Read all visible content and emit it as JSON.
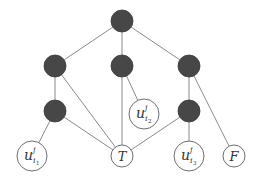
{
  "diagram": {
    "type": "graph",
    "colors": {
      "filled_node": "#474747",
      "edge": "#8a8a8a",
      "open_node_stroke": "#6e6e6e",
      "background": "#ffffff"
    },
    "nodes": [
      {
        "id": "top",
        "kind": "filled",
        "x": 122,
        "y": 21,
        "r": 11
      },
      {
        "id": "l1",
        "kind": "filled",
        "x": 55,
        "y": 66,
        "r": 11
      },
      {
        "id": "m1",
        "kind": "filled",
        "x": 122,
        "y": 66,
        "r": 11
      },
      {
        "id": "r1",
        "kind": "filled",
        "x": 189,
        "y": 66,
        "r": 11
      },
      {
        "id": "l2",
        "kind": "filled",
        "x": 55,
        "y": 111,
        "r": 11
      },
      {
        "id": "r2",
        "kind": "filled",
        "x": 189,
        "y": 111,
        "r": 11
      },
      {
        "id": "u_i2",
        "kind": "open",
        "x": 144,
        "y": 114,
        "r": 15,
        "label": "u",
        "sup": "j",
        "sub": "i",
        "subsub": "2"
      },
      {
        "id": "u_i1",
        "kind": "open",
        "x": 32,
        "y": 156,
        "r": 15,
        "label": "u",
        "sup": "j",
        "sub": "i",
        "subsub": "1"
      },
      {
        "id": "T",
        "kind": "open",
        "x": 122,
        "y": 156,
        "r": 11,
        "label": "T"
      },
      {
        "id": "u_i3",
        "kind": "open",
        "x": 189,
        "y": 156,
        "r": 15,
        "label": "u",
        "sup": "j",
        "sub": "i",
        "subsub": "3"
      },
      {
        "id": "F",
        "kind": "open",
        "x": 234,
        "y": 156,
        "r": 11,
        "label": "F"
      }
    ],
    "edges": [
      [
        "top",
        "l1"
      ],
      [
        "top",
        "m1"
      ],
      [
        "top",
        "r1"
      ],
      [
        "l1",
        "l2"
      ],
      [
        "l1",
        "T"
      ],
      [
        "m1",
        "T"
      ],
      [
        "m1",
        "u_i2"
      ],
      [
        "r1",
        "r2"
      ],
      [
        "r1",
        "F"
      ],
      [
        "l2",
        "u_i1"
      ],
      [
        "l2",
        "T"
      ],
      [
        "r2",
        "T"
      ],
      [
        "r2",
        "u_i3"
      ]
    ]
  }
}
